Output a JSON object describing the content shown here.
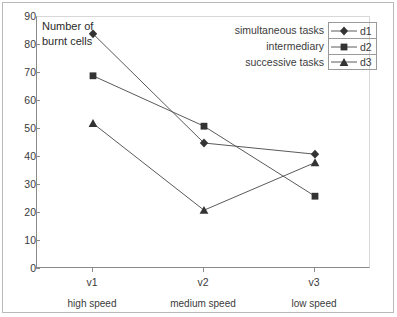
{
  "chart_data": {
    "type": "line",
    "title": "",
    "axis_note": "Number of burnt cells",
    "xlabel": "",
    "ylabel": "Number of burnt cells",
    "categories": [
      "v1",
      "v2",
      "v3"
    ],
    "category_sublabels": [
      "high speed",
      "medium speed",
      "low speed"
    ],
    "ylim": [
      0,
      90
    ],
    "yticks": [
      90,
      80,
      70,
      60,
      50,
      40,
      30,
      20,
      10,
      0
    ],
    "grid": false,
    "legend_position": "top-right",
    "series": [
      {
        "name": "d1",
        "description": "simultaneous tasks",
        "marker": "diamond",
        "color": "#333333",
        "values": [
          84,
          45,
          41
        ]
      },
      {
        "name": "d2",
        "description": "intermediary",
        "marker": "square",
        "color": "#333333",
        "values": [
          69,
          51,
          26
        ]
      },
      {
        "name": "d3",
        "description": "successive tasks",
        "marker": "triangle",
        "color": "#333333",
        "values": [
          52,
          21,
          38
        ]
      }
    ]
  },
  "legend": {
    "rows": [
      {
        "description": "simultaneous tasks",
        "key": "d1"
      },
      {
        "description": "intermediary",
        "key": "d2"
      },
      {
        "description": "successive tasks",
        "key": "d3"
      }
    ]
  },
  "axis": {
    "y_title_line1": "Number of",
    "y_title_line2": "burnt cells",
    "y_labels": [
      "90",
      "80",
      "70",
      "60",
      "50",
      "40",
      "30",
      "20",
      "10",
      "0"
    ],
    "x_categories": [
      "v1",
      "v2",
      "v3"
    ],
    "x_sublabels": [
      "high speed",
      "medium speed",
      "low speed"
    ]
  },
  "colors": {
    "line": "#5a5a5a",
    "marker": "#333333",
    "axis": "#8a8a8a",
    "frame": "#b9b9b9",
    "text": "#3b3b3b"
  }
}
